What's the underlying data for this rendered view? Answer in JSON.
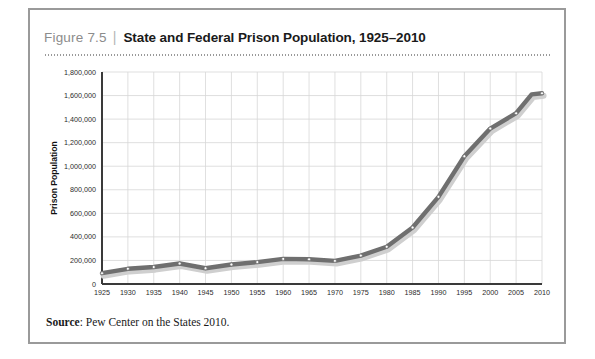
{
  "figure": {
    "number": "Figure 7.5",
    "separator": "|",
    "title": "State and Federal Prison Population, 1925–2010"
  },
  "source": {
    "label": "Source",
    "separator": ":",
    "text": "Pew Center on the States 2010."
  },
  "colors": {
    "line": "#6f6f6f",
    "line_shadow": "#cfcfcf",
    "marker_fill": "#ffffff",
    "marker_stroke": "#6f6f6f",
    "grid": "#d7d7d7",
    "axis": "#3a3a3a",
    "figure_border": "#9a9a9a",
    "fig_number_text": "#8c8c8c",
    "title_text": "#1a1a1a"
  },
  "chart_data": {
    "type": "line",
    "title": "State and Federal Prison Population, 1925–2010",
    "xlabel": "",
    "ylabel": "Prison Population",
    "xlim": [
      1925,
      2010
    ],
    "ylim": [
      0,
      1800000
    ],
    "ytick_step": 200000,
    "xtick_step": 5,
    "grid": true,
    "legend": "none",
    "xticks": [
      1925,
      1930,
      1935,
      1940,
      1945,
      1950,
      1955,
      1960,
      1965,
      1970,
      1975,
      1980,
      1985,
      1990,
      1995,
      2000,
      2005,
      2010
    ],
    "ytick_labels": [
      "0",
      "200,000",
      "400,000",
      "600,000",
      "800,000",
      "1,000,000",
      "1,200,000",
      "1,400,000",
      "1,600,000",
      "1,800,000"
    ],
    "yticks": [
      0,
      200000,
      400000,
      600000,
      800000,
      1000000,
      1200000,
      1400000,
      1600000,
      1800000
    ],
    "x": [
      1925,
      1930,
      1935,
      1940,
      1945,
      1950,
      1955,
      1960,
      1965,
      1970,
      1975,
      1980,
      1985,
      1990,
      1995,
      2000,
      2005,
      2008,
      2010
    ],
    "values": [
      92000,
      129000,
      144000,
      174000,
      134000,
      166000,
      186000,
      213000,
      210000,
      196000,
      241000,
      316000,
      480000,
      740000,
      1085000,
      1320000,
      1450000,
      1610000,
      1620000
    ],
    "series": [
      {
        "name": "State and Federal Prison Population",
        "values": [
          92000,
          129000,
          144000,
          174000,
          134000,
          166000,
          186000,
          213000,
          210000,
          196000,
          241000,
          316000,
          480000,
          740000,
          1085000,
          1320000,
          1450000,
          1610000,
          1620000
        ]
      }
    ]
  }
}
